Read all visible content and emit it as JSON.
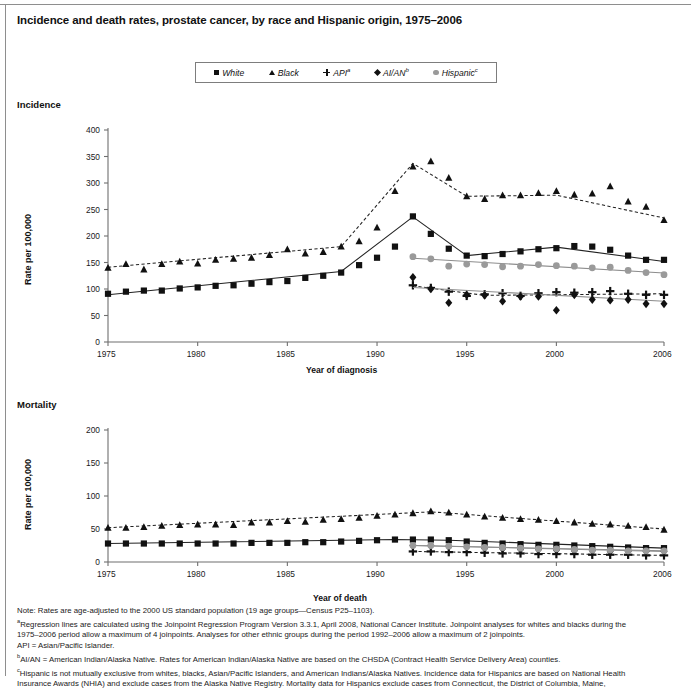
{
  "title": "Incidence and death rates, prostate cancer, by race and Hispanic origin, 1975–2006",
  "legend": {
    "items": [
      {
        "label": "White",
        "marker": "square",
        "marker_name": "legend-marker-square",
        "sup": ""
      },
      {
        "label": "Black",
        "marker": "tri",
        "marker_name": "legend-marker-triangle",
        "sup": ""
      },
      {
        "label": "API",
        "marker": "plus",
        "marker_name": "legend-marker-plus",
        "sup": "a"
      },
      {
        "label": "AI/AN",
        "marker": "diamond",
        "marker_name": "legend-marker-diamond",
        "sup": "b"
      },
      {
        "label": "Hispanic",
        "marker": "circle",
        "marker_name": "legend-marker-circle",
        "sup": "c"
      }
    ]
  },
  "panels": {
    "incidence_label": "Incidence",
    "mortality_label": "Mortality",
    "ylabel": "Rate per 100,000",
    "xlabel_top": "Year of diagnosis",
    "xlabel_bottom": "Year of death"
  },
  "notes": {
    "note": "Note: Rates are age-adjusted to the 2000 US standard population (19 age groups—Census P25–1103).",
    "a1": "Regression lines are calculated using the Joinpoint Regression Program Version 3.3.1, April 2008, National Cancer Institute. Joinpoint analyses for whites and blacks during the",
    "a2": "1975–2006 period allow a maximum of 4 joinpoints. Analyses for other ethnic groups during the period 1992–2006 allow a maximum of 2 joinpoints.",
    "a3": "API = Asian/Pacific Islander.",
    "b1": "AI/AN = American Indian/Alaska Native. Rates for American Indian/Alaska Native are based on the CHSDA (Contract Health Service Delivery Area) counties.",
    "c1": "Hispanic is not mutually exclusive from whites, blacks, Asian/Pacific Islanders, and American Indians/Alaska Natives. Incidence data for Hispanics are based on National Health",
    "c2": "Insurance Awards (NHIA) and exclude cases from the Alaska Native Registry. Mortality data for Hispanics exclude cases from Connecticut, the District of Columbia, Maine,"
  },
  "colors": {
    "dark": "#111111",
    "gray": "#9a9a9a",
    "axis": "#6f6f6f",
    "frame": "#8e8e8e"
  },
  "chart_data": [
    {
      "type": "line",
      "id": "incidence",
      "title": "Incidence",
      "xlabel": "Year of diagnosis",
      "ylabel": "Rate per 100,000",
      "xlim": [
        1975,
        2006
      ],
      "ylim": [
        0,
        400
      ],
      "yticks": [
        0,
        50,
        100,
        150,
        200,
        250,
        300,
        350,
        400
      ],
      "xticks": [
        1975,
        1980,
        1985,
        1990,
        1995,
        2000,
        2006
      ],
      "xtick_labels": [
        "1975",
        "1980",
        "1985",
        "1990",
        "1995",
        "2000",
        "2006"
      ],
      "grid": false,
      "legend_position": "top-center",
      "series": [
        {
          "name": "White",
          "marker": "square",
          "color": "#111111",
          "linestyle": "solid",
          "x": [
            1975,
            1976,
            1977,
            1978,
            1979,
            1980,
            1981,
            1982,
            1983,
            1984,
            1985,
            1986,
            1987,
            1988,
            1989,
            1990,
            1991,
            1992,
            1993,
            1994,
            1995,
            1996,
            1997,
            1998,
            1999,
            2000,
            2001,
            2002,
            2003,
            2004,
            2005,
            2006
          ],
          "values": [
            91,
            95,
            97,
            97,
            101,
            103,
            106,
            107,
            110,
            113,
            115,
            121,
            125,
            131,
            145,
            159,
            180,
            237,
            204,
            176,
            163,
            162,
            166,
            171,
            175,
            177,
            181,
            180,
            174,
            163,
            155,
            155
          ],
          "fit_points": [
            [
              1975,
              89
            ],
            [
              1988,
              133
            ],
            [
              1992,
              236
            ],
            [
              1995,
              163
            ],
            [
              2000,
              179
            ],
            [
              2006,
              152
            ]
          ]
        },
        {
          "name": "Black",
          "marker": "triangle",
          "color": "#111111",
          "linestyle": "dashed",
          "x": [
            1975,
            1976,
            1977,
            1978,
            1979,
            1980,
            1981,
            1982,
            1983,
            1984,
            1985,
            1986,
            1987,
            1988,
            1989,
            1990,
            1991,
            1992,
            1993,
            1994,
            1995,
            1996,
            1997,
            1998,
            1999,
            2000,
            2001,
            2002,
            2003,
            2004,
            2005,
            2006
          ],
          "values": [
            140,
            147,
            137,
            147,
            152,
            148,
            155,
            157,
            159,
            164,
            175,
            167,
            170,
            180,
            190,
            216,
            285,
            331,
            341,
            310,
            275,
            270,
            277,
            277,
            281,
            285,
            278,
            280,
            294,
            265,
            255,
            230
          ],
          "fit_points": [
            [
              1975,
              141
            ],
            [
              1988,
              180
            ],
            [
              1992,
              337
            ],
            [
              1995,
              275
            ],
            [
              2000,
              277
            ],
            [
              2006,
              234
            ]
          ]
        },
        {
          "name": "API",
          "marker": "plus",
          "color": "#111111",
          "linestyle": "dashed",
          "x": [
            1992,
            1993,
            1994,
            1995,
            1996,
            1997,
            1998,
            1999,
            2000,
            2001,
            2002,
            2003,
            2004,
            2005,
            2006
          ],
          "values": [
            107,
            102,
            95,
            87,
            90,
            92,
            87,
            92,
            94,
            93,
            94,
            96,
            91,
            89,
            89
          ],
          "fit_points": [
            [
              1992,
              106
            ],
            [
              1996,
              88
            ],
            [
              2006,
              91
            ]
          ]
        },
        {
          "name": "AI/AN",
          "marker": "diamond",
          "color": "#111111",
          "linestyle": "solid-gray",
          "x": [
            1992,
            1993,
            1994,
            1995,
            1996,
            1997,
            1998,
            1999,
            2000,
            2001,
            2002,
            2003,
            2004,
            2005,
            2006
          ],
          "values": [
            122,
            100,
            74,
            89,
            88,
            77,
            86,
            86,
            60,
            89,
            80,
            79,
            80,
            72,
            72
          ],
          "fit_points": [
            [
              1992,
              103
            ],
            [
              2006,
              77
            ]
          ]
        },
        {
          "name": "Hispanic",
          "marker": "circle",
          "color": "#9a9a9a",
          "linestyle": "solid-gray",
          "x": [
            1992,
            1993,
            1994,
            1995,
            1996,
            1997,
            1998,
            1999,
            2000,
            2001,
            2002,
            2003,
            2004,
            2005,
            2006
          ],
          "values": [
            161,
            157,
            143,
            147,
            146,
            142,
            143,
            146,
            144,
            143,
            140,
            141,
            135,
            131,
            127
          ],
          "fit_points": [
            [
              1992,
              158
            ],
            [
              2006,
              130
            ]
          ]
        }
      ]
    },
    {
      "type": "line",
      "id": "mortality",
      "title": "Mortality",
      "xlabel": "Year of death",
      "ylabel": "Rate per 100,000",
      "xlim": [
        1975,
        2006
      ],
      "ylim": [
        0,
        200
      ],
      "yticks": [
        0,
        50,
        100,
        150,
        200
      ],
      "xticks": [
        1975,
        1980,
        1985,
        1990,
        1995,
        2000,
        2006
      ],
      "xtick_labels": [
        "1975",
        "1980",
        "1985",
        "1990",
        "1995",
        "2000",
        "2006"
      ],
      "grid": false,
      "legend_position": "top-center",
      "series": [
        {
          "name": "White",
          "marker": "square",
          "color": "#111111",
          "linestyle": "solid",
          "x": [
            1975,
            1976,
            1977,
            1978,
            1979,
            1980,
            1981,
            1982,
            1983,
            1984,
            1985,
            1986,
            1987,
            1988,
            1989,
            1990,
            1991,
            1992,
            1993,
            1994,
            1995,
            1996,
            1997,
            1998,
            1999,
            2000,
            2001,
            2002,
            2003,
            2004,
            2005,
            2006
          ],
          "values": [
            28,
            28,
            28,
            28,
            28,
            28,
            28,
            28,
            29,
            29,
            29,
            30,
            30,
            31,
            32,
            33,
            34,
            34,
            34,
            33,
            31,
            29,
            28,
            27,
            26,
            26,
            25,
            24,
            23,
            22,
            21,
            21
          ],
          "fit_points": [
            [
              1975,
              28
            ],
            [
              1991,
              34
            ],
            [
              1994,
              33
            ],
            [
              2006,
              21
            ]
          ]
        },
        {
          "name": "Black",
          "marker": "triangle",
          "color": "#111111",
          "linestyle": "dashed",
          "x": [
            1975,
            1976,
            1977,
            1978,
            1979,
            1980,
            1981,
            1982,
            1983,
            1984,
            1985,
            1986,
            1987,
            1988,
            1989,
            1990,
            1991,
            1992,
            1993,
            1994,
            1995,
            1996,
            1997,
            1998,
            1999,
            2000,
            2001,
            2002,
            2003,
            2004,
            2005,
            2006
          ],
          "values": [
            52,
            52,
            53,
            55,
            56,
            57,
            57,
            56,
            60,
            60,
            62,
            61,
            64,
            65,
            67,
            70,
            72,
            74,
            77,
            75,
            72,
            69,
            67,
            65,
            64,
            62,
            60,
            58,
            57,
            55,
            53,
            49
          ],
          "fit_points": [
            [
              1975,
              52
            ],
            [
              1993,
              76
            ],
            [
              2006,
              50
            ]
          ]
        },
        {
          "name": "API",
          "marker": "plus",
          "color": "#111111",
          "linestyle": "dashed",
          "x": [
            1992,
            1993,
            1994,
            1995,
            1996,
            1997,
            1998,
            1999,
            2000,
            2001,
            2002,
            2003,
            2004,
            2005,
            2006
          ],
          "values": [
            16,
            16,
            15,
            15,
            14,
            13,
            13,
            12,
            12,
            12,
            11,
            11,
            11,
            10,
            10
          ],
          "fit_points": [
            [
              1992,
              16
            ],
            [
              2006,
              10
            ]
          ]
        },
        {
          "name": "AI/AN",
          "marker": "diamond",
          "color": "#111111",
          "linestyle": "solid-gray",
          "x": [
            1992,
            1993,
            1994,
            1995,
            1996,
            1997,
            1998,
            1999,
            2000,
            2001,
            2002,
            2003,
            2004,
            2005,
            2006
          ],
          "values": [
            25,
            25,
            24,
            23,
            21,
            20,
            19,
            19,
            18,
            17,
            17,
            16,
            16,
            16,
            16
          ],
          "fit_points": [
            [
              1992,
              25
            ],
            [
              2006,
              16
            ]
          ]
        },
        {
          "name": "Hispanic",
          "marker": "circle",
          "color": "#9a9a9a",
          "linestyle": "solid-gray",
          "x": [
            1992,
            1993,
            1994,
            1995,
            1996,
            1997,
            1998,
            1999,
            2000,
            2001,
            2002,
            2003,
            2004,
            2005,
            2006
          ],
          "values": [
            25,
            25,
            24,
            23,
            22,
            22,
            21,
            20,
            20,
            19,
            18,
            18,
            17,
            17,
            17
          ],
          "fit_points": [
            [
              1992,
              25
            ],
            [
              2006,
              17
            ]
          ]
        }
      ]
    }
  ]
}
